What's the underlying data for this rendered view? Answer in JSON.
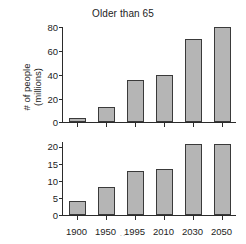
{
  "figure": {
    "title": "Older than 65",
    "footer_mark": "··",
    "bar_fill_color": "#b5b5b5",
    "bar_edge_color": "#3a3a3a",
    "axis_color": "#2b2b2b",
    "background_color": "#ffffff"
  },
  "panels": {
    "top": {
      "ylabel_line1": "# of people",
      "ylabel_line2": "(millions)",
      "yticks": [
        "80",
        "60",
        "40",
        "20",
        "0"
      ]
    },
    "bottom": {
      "ylabel": "% of population",
      "yticks": [
        "20",
        "15",
        "10",
        "5",
        "0"
      ],
      "xticks": [
        "1900",
        "1950",
        "1995",
        "2010",
        "2030",
        "2050"
      ]
    }
  },
  "chart_data": [
    {
      "type": "bar",
      "title": "Older than 65",
      "xlabel": "",
      "ylabel": "# of people (millions)",
      "categories": [
        "1900",
        "1950",
        "1995",
        "2010",
        "2030",
        "2050"
      ],
      "values": [
        3,
        12.5,
        35,
        40,
        70,
        80
      ],
      "ylim": [
        0,
        80
      ],
      "yticks": [
        0,
        20,
        40,
        60,
        80
      ],
      "grid": false,
      "legend": "none",
      "bar_color": "#b5b5b5"
    },
    {
      "type": "bar",
      "title": "",
      "xlabel": "",
      "ylabel": "% of population",
      "categories": [
        "1900",
        "1950",
        "1995",
        "2010",
        "2030",
        "2050"
      ],
      "values": [
        4,
        8,
        12.7,
        13.3,
        20.5,
        20.5
      ],
      "ylim": [
        0,
        21.5
      ],
      "yticks": [
        0,
        5,
        10,
        15,
        20
      ],
      "grid": false,
      "legend": "none",
      "bar_color": "#b5b5b5"
    }
  ]
}
